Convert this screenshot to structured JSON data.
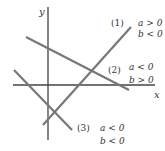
{
  "axes": {
    "x_label": "x",
    "y_label": "y",
    "color": "#333333"
  },
  "lines": [
    {
      "id": "1",
      "number_label": "(1)",
      "condition_a": "a > 0",
      "condition_b": "b < 0",
      "color": "#777777"
    },
    {
      "id": "2",
      "number_label": "(2)",
      "condition_a": "a < 0",
      "condition_b": "b > 0",
      "color": "#777777"
    },
    {
      "id": "3",
      "number_label": "(3)",
      "condition_a": "a < 0",
      "condition_b": "b < 0",
      "color": "#777777"
    }
  ]
}
